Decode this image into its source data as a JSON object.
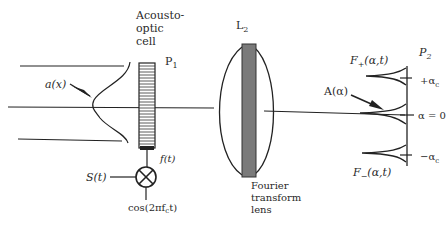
{
  "diagram": {
    "labels": {
      "acousto_line1": "Acousto-",
      "acousto_line2": "optic",
      "acousto_line3": "cell",
      "p1": "P",
      "p1_sub": "1",
      "ax": "a(x)",
      "ft": "f(t)",
      "st": "S(t)",
      "cos": "cos(2πf",
      "cos_sub": "c",
      "cos_tail": "t)",
      "l2": "L",
      "l2_sub": "2",
      "fourier_line1": "Fourier",
      "fourier_line2": "transform",
      "fourier_line3": "lens",
      "p2": "P",
      "p2_sub": "2",
      "fplus": "F",
      "fplus_sub": "+",
      "fplus_tail": "(α,t)",
      "fminus": "F",
      "fminus_sub": "−",
      "fminus_tail": "(α,t)",
      "aalpha": "A(α)",
      "plus_ac": "+α",
      "plus_ac_sub": "c",
      "alpha0": "α = 0",
      "minus_ac": "−α",
      "minus_ac_sub": "c"
    },
    "colors": {
      "line": "#222222",
      "lens_bar": "#7a7a7a",
      "text": "#2a2a2a"
    }
  }
}
